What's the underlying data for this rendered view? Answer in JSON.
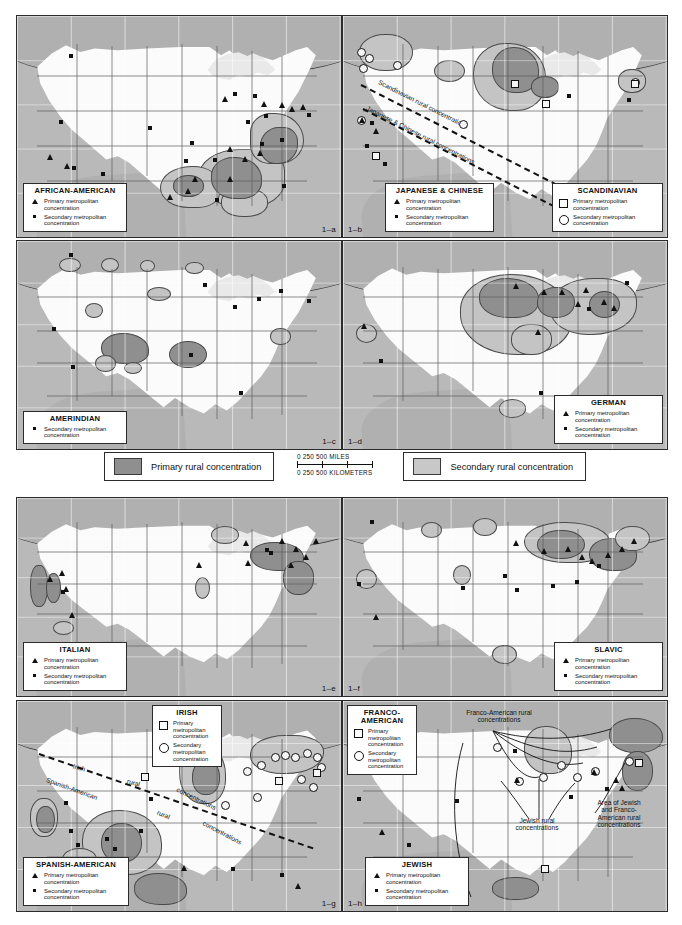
{
  "figure": {
    "background_color": "#ffffff"
  },
  "shared_legend": {
    "primary_rural_label": "Primary rural concentration",
    "secondary_rural_label": "Secondary rural concentration",
    "primary_rural_color": "#8f8f8f",
    "secondary_rural_color": "#c8c8c8",
    "scale": {
      "miles_ticks": [
        "0",
        "250",
        "500"
      ],
      "miles_unit": "MILES",
      "km_ticks": [
        "0",
        "250",
        "500"
      ],
      "km_unit": "KILOMETERS",
      "miles_line": "0      250        500 MILES",
      "km_line": "0   250   500 KILOMETERS"
    }
  },
  "symbol_labels": {
    "primary_metropolitan": "Primary metropolitan concentration",
    "secondary_metropolitan": "Secondary metropolitan concentration",
    "primary_metropolitan_l1": "Primary metropolitan",
    "primary_metropolitan_l2": "concentration",
    "secondary_metropolitan_l1": "Secondary metropolitan",
    "secondary_metropolitan_l2": "concentration",
    "primary_stacked": "Primary\nmetropolitan\nconcentration",
    "secondary_stacked": "Secondary\nmetropolitan\nconcentration"
  },
  "panels": [
    {
      "id": "1-a",
      "fignum": "1–a",
      "groups": [
        {
          "name": "AFRICAN-AMERICAN",
          "keys": [
            {
              "symbol": "triangle",
              "label": "Primary metropolitan\nconcentration"
            },
            {
              "symbol": "dot",
              "label": "Secondary metropolitan\nconcentration"
            }
          ]
        }
      ],
      "annotations": []
    },
    {
      "id": "1-b",
      "fignum": "1–b",
      "groups": [
        {
          "name": "JAPANESE & CHINESE",
          "keys": [
            {
              "symbol": "triangle",
              "label": "Primary metropolitan\nconcentration"
            },
            {
              "symbol": "dot",
              "label": "Secondary metropolitan\nconcentration"
            }
          ]
        },
        {
          "name": "SCANDINAVIAN",
          "keys": [
            {
              "symbol": "square",
              "label": "Primary metropolitan\nconcentration"
            },
            {
              "symbol": "circle",
              "label": "Secondary metropolitan\nconcentration"
            }
          ]
        }
      ],
      "annotations": [
        {
          "text": "Scandinavian rural concentrations"
        },
        {
          "text": "Japanese & Chinese rural concentrations"
        }
      ]
    },
    {
      "id": "1-c",
      "fignum": "1–c",
      "groups": [
        {
          "name": "AMERINDIAN",
          "keys": [
            {
              "symbol": "dot",
              "label": "Secondary metropolitan\nconcentration"
            }
          ]
        }
      ],
      "annotations": []
    },
    {
      "id": "1-d",
      "fignum": "1–d",
      "groups": [
        {
          "name": "GERMAN",
          "keys": [
            {
              "symbol": "triangle",
              "label": "Primary metropolitan\nconcentration"
            },
            {
              "symbol": "dot",
              "label": "Secondary metropolitan\nconcentration"
            }
          ]
        }
      ],
      "annotations": []
    },
    {
      "id": "1-e",
      "fignum": "1–e",
      "groups": [
        {
          "name": "ITALIAN",
          "keys": [
            {
              "symbol": "triangle",
              "label": "Primary metropolitan\nconcentration"
            },
            {
              "symbol": "dot",
              "label": "Secondary metropolitan\nconcentration"
            }
          ]
        }
      ],
      "annotations": []
    },
    {
      "id": "1-f",
      "fignum": "1–f",
      "groups": [
        {
          "name": "SLAVIC",
          "keys": [
            {
              "symbol": "triangle",
              "label": "Primary metropolitan\nconcentration"
            },
            {
              "symbol": "dot",
              "label": "Secondary metropolitan\nconcentration"
            }
          ]
        }
      ],
      "annotations": []
    },
    {
      "id": "1-g",
      "fignum": "1–g",
      "groups": [
        {
          "name": "IRISH",
          "keys": [
            {
              "symbol": "square",
              "label": "Primary\nmetropolitan\nconcentration"
            },
            {
              "symbol": "circle",
              "label": "Secondary\nmetropolitan\nconcentration"
            }
          ]
        },
        {
          "name": "SPANISH-AMERICAN",
          "keys": [
            {
              "symbol": "triangle",
              "label": "Primary metropolitan\nconcentration"
            },
            {
              "symbol": "dot",
              "label": "Secondary metropolitan\nconcentration"
            }
          ]
        }
      ],
      "annotations": [
        {
          "text": "Irish rural concentrations"
        },
        {
          "text": "Spanish-American rural concentrations"
        }
      ]
    },
    {
      "id": "1-h",
      "fignum": "1–h",
      "groups": [
        {
          "name": "FRANCO-\nAMERICAN",
          "keys": [
            {
              "symbol": "square",
              "label": "Primary\nmetropolitan\nconcentration"
            },
            {
              "symbol": "circle",
              "label": "Secondary\nmetropolitan\nconcentration"
            }
          ]
        },
        {
          "name": "JEWISH",
          "keys": [
            {
              "symbol": "triangle",
              "label": "Primary metropolitan\nconcentration"
            },
            {
              "symbol": "dot",
              "label": "Secondary metropolitan\nconcentration"
            }
          ]
        }
      ],
      "annotations": [
        {
          "text": "Franco-American rural\nconcentrations"
        },
        {
          "text": "Jewish rural\nconcentrations"
        },
        {
          "text": "Area of Jewish\nand Franco-\nAmerican rural\nconcentrations"
        }
      ]
    }
  ],
  "text": {
    "p1a_title": "AFRICAN-AMERICAN",
    "p1b_title1": "JAPANESE & CHINESE",
    "p1b_title2": "SCANDINAVIAN",
    "p1b_anno1": "Scandinavian rural concentrations",
    "p1b_anno2": "Japanese & Chinese rural concentrations",
    "p1c_title": "AMERINDIAN",
    "p1d_title": "GERMAN",
    "p1e_title": "ITALIAN",
    "p1f_title": "SLAVIC",
    "p1g_title1": "IRISH",
    "p1g_title2": "SPANISH-AMERICAN",
    "p1g_anno1a": "Irish",
    "p1g_anno1b": "rural",
    "p1g_anno1c": "concentrations",
    "p1g_anno2a": "Spanish-American",
    "p1g_anno2b": "rural",
    "p1g_anno2c": "concentrations",
    "p1h_title1": "FRANCO-\nAMERICAN",
    "p1h_title2": "JEWISH",
    "p1h_anno1": "Franco-American rural\nconcentrations",
    "p1h_anno2": "Jewish rural\nconcentrations",
    "p1h_anno3": "Area of Jewish\nand Franco-\nAmerican rural\nconcentrations",
    "fig_a": "1–a",
    "fig_b": "1–b",
    "fig_c": "1–c",
    "fig_d": "1–d",
    "fig_e": "1–e",
    "fig_f": "1–f",
    "fig_g": "1–g",
    "fig_h": "1–h",
    "primary_rural": "Primary rural concentration",
    "secondary_rural": "Secondary rural concentration",
    "scale_miles": "0      250       500 MILES",
    "scale_km": "0   250   500 KILOMETERS",
    "sym_pri_l1": "Primary metropolitan",
    "sym_pri_l2": "concentration",
    "sym_sec_l1": "Secondary metropolitan",
    "sym_sec_l2": "concentration",
    "sym_pri_s1": "Primary",
    "sym_pri_s2": "metropolitan",
    "sym_pri_s3": "concentration",
    "sym_sec_s1": "Secondary",
    "sym_sec_s2": "metropolitan",
    "sym_sec_s3": "concentration"
  }
}
